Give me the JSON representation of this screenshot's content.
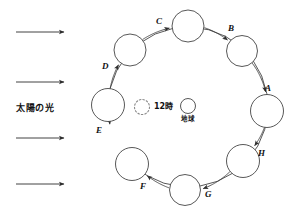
{
  "diagram": {
    "stroke_color": "#3a3a3a",
    "sun_rays": {
      "name": "sunlight-rays",
      "label": "太陽の光",
      "count": 4,
      "direction": "right",
      "arrows": [
        {
          "x1": 16,
          "y1": 32,
          "x2": 64,
          "y2": 32
        },
        {
          "x1": 16,
          "y1": 82,
          "x2": 64,
          "y2": 82
        },
        {
          "x1": 16,
          "y1": 138,
          "x2": 64,
          "y2": 138
        },
        {
          "x1": 16,
          "y1": 184,
          "x2": 64,
          "y2": 184
        }
      ],
      "label_x": 16,
      "label_y": 104
    },
    "center": {
      "hour_marker": {
        "name": "noon-dotted-circle",
        "label": "12時",
        "cx": 142,
        "cy": 107,
        "r": 7.5,
        "label_x": 154,
        "label_y": 103
      },
      "earth_marker": {
        "name": "earth-circle",
        "label": "地球",
        "cx": 188,
        "cy": 106,
        "r": 7.5,
        "label_x": 181,
        "label_y": 116
      }
    },
    "orbit": {
      "cx": 188,
      "cy": 107,
      "rx": 80,
      "ry": 83,
      "positions": [
        {
          "id": "A",
          "label": "A",
          "cx": 267,
          "cy": 111,
          "r": 16.5,
          "label_x": 265,
          "label_y": 84
        },
        {
          "id": "B",
          "label": "B",
          "cx": 242,
          "cy": 51,
          "r": 15.5,
          "label_x": 228,
          "label_y": 24
        },
        {
          "id": "C",
          "label": "C",
          "cx": 188,
          "cy": 26,
          "r": 16.0,
          "label_x": 156,
          "label_y": 17
        },
        {
          "id": "D",
          "label": "D",
          "cx": 130,
          "cy": 50,
          "r": 16.0,
          "label_x": 102,
          "label_y": 62
        },
        {
          "id": "E",
          "label": "E",
          "cx": 108,
          "cy": 105,
          "r": 16.5,
          "label_x": 96,
          "label_y": 126
        },
        {
          "id": "F",
          "label": "F",
          "cx": 132,
          "cy": 164,
          "r": 16.5,
          "label_x": 140,
          "label_y": 182
        },
        {
          "id": "G",
          "label": "G",
          "cx": 185,
          "cy": 190,
          "r": 15.5,
          "label_x": 205,
          "label_y": 190
        },
        {
          "id": "H",
          "label": "H",
          "cx": 243,
          "cy": 161,
          "r": 16.5,
          "label_x": 258,
          "label_y": 149
        }
      ],
      "rotation_direction": "counterclockwise",
      "arc_arrows": [
        {
          "from": "G",
          "to": "F"
        },
        {
          "from": "H",
          "to": "G"
        },
        {
          "from": "A",
          "to": "H"
        },
        {
          "from": "B",
          "to": "A"
        },
        {
          "from": "C",
          "to": "B"
        },
        {
          "from": "D",
          "to": "C"
        },
        {
          "from": "E",
          "to": "D"
        },
        {
          "from": "F",
          "to": "E"
        }
      ]
    }
  }
}
